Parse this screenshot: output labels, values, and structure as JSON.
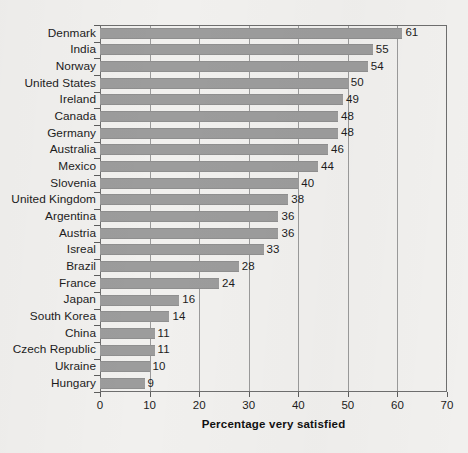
{
  "chart_data": {
    "type": "bar",
    "orientation": "horizontal",
    "title": "",
    "xlabel": "Percentage very satisfied",
    "ylabel": "",
    "xlim": [
      0,
      70
    ],
    "xticks": [
      0,
      10,
      20,
      30,
      40,
      50,
      60,
      70
    ],
    "grid": true,
    "grid_axis": "x",
    "legend": false,
    "bar_color": "#9c9c9c",
    "categories": [
      "Denmark",
      "India",
      "Norway",
      "United States",
      "Ireland",
      "Canada",
      "Germany",
      "Australia",
      "Mexico",
      "Slovenia",
      "United Kingdom",
      "Argentina",
      "Austria",
      "Isreal",
      "Brazil",
      "France",
      "Japan",
      "South Korea",
      "China",
      "Czech Republic",
      "Ukraine",
      "Hungary"
    ],
    "values": [
      61,
      55,
      54,
      50,
      49,
      48,
      48,
      46,
      44,
      40,
      38,
      36,
      36,
      33,
      28,
      24,
      16,
      14,
      11,
      11,
      10,
      9
    ],
    "value_labels": [
      "61",
      "55",
      "54",
      "50",
      "49",
      "48",
      "48",
      "46",
      "44",
      "40",
      "38",
      "36",
      "36",
      "33",
      "28",
      "24",
      "16",
      "14",
      "11",
      "11",
      "10",
      "9"
    ],
    "xtick_labels": [
      "0",
      "10",
      "20",
      "30",
      "40",
      "50",
      "60",
      "70"
    ]
  }
}
